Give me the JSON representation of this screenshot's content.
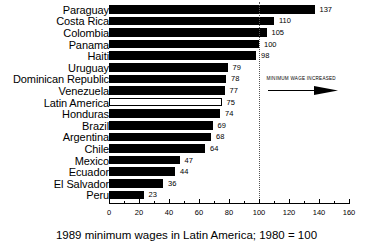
{
  "chart_data": {
    "type": "bar",
    "orientation": "horizontal",
    "title": "",
    "caption": "1989 minimum wages in Latin America; 1980 = 100",
    "xlabel": "",
    "ylabel": "",
    "xlim": [
      0,
      160
    ],
    "xticks": [
      0,
      20,
      40,
      60,
      80,
      100,
      120,
      140,
      160
    ],
    "xtick_labels": [
      "0",
      "20",
      "40",
      "60",
      "80",
      "100",
      "120",
      "140",
      "160"
    ],
    "minor_tick_step": 10,
    "grid": false,
    "legend": false,
    "categories": [
      "Paraguay",
      "Costa Rica",
      "Colombia",
      "Panama",
      "Haiti",
      "Uruguay",
      "Dominican Republic",
      "Venezuela",
      "Latin America",
      "Honduras",
      "Brazil",
      "Argentina",
      "Chile",
      "Mexico",
      "Ecuador",
      "El Salvador",
      "Peru"
    ],
    "values": [
      137,
      110,
      105,
      100,
      98,
      79,
      78,
      77,
      75,
      74,
      69,
      68,
      64,
      47,
      44,
      36,
      23
    ],
    "bar_styles": [
      "filled",
      "filled",
      "filled",
      "filled",
      "filled",
      "filled",
      "filled",
      "filled",
      "hollow",
      "filled",
      "filled",
      "filled",
      "filled",
      "filled",
      "filled",
      "filled",
      "filled"
    ],
    "reference_line": {
      "value": 100,
      "style": "dotted",
      "color": "#555555"
    },
    "annotations": [
      {
        "text": "MINIMUM WAGE INCREASED",
        "x": 105,
        "row_index": 6,
        "arrow": "right"
      }
    ],
    "colors": {
      "bar_fill": "#000000",
      "bar_outline": "#000000",
      "hollow_fill": "#ffffff",
      "background": "#ffffff",
      "text": "#000000"
    }
  }
}
